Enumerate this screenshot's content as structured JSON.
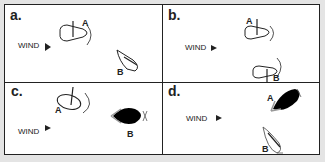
{
  "panels": [
    {
      "label": "a.",
      "wind_label": "WIND",
      "boat_a": "A",
      "boat_b": "B"
    },
    {
      "label": "b.",
      "wind_label": "WIND",
      "boat_a": "A",
      "boat_b": "B"
    },
    {
      "label": "c.",
      "wind_label": "WIND",
      "boat_a": "A",
      "boat_b": "B"
    },
    {
      "label": "d.",
      "wind_label": "WIND",
      "boat_a": "A",
      "boat_b": "B"
    }
  ],
  "colors": {
    "background": "#e4e4e4",
    "panel": "#ffffff",
    "ink": "#222222",
    "fill_boat": "#000000",
    "sail_gray": "#999999"
  }
}
